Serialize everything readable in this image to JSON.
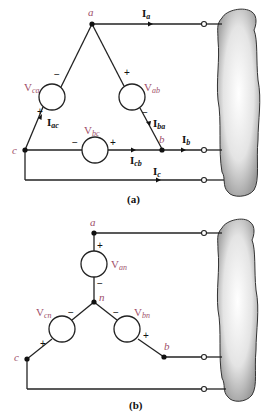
{
  "figure_a": {
    "caption": "(a)",
    "nodes": {
      "a": "a",
      "b": "b",
      "c": "c"
    },
    "sources": [
      {
        "id": "ca",
        "base": "V",
        "sub": "ca"
      },
      {
        "id": "ab",
        "base": "V",
        "sub": "ab"
      },
      {
        "id": "bc",
        "base": "V",
        "sub": "bc"
      }
    ],
    "currents": [
      {
        "id": "a",
        "base": "I",
        "sub": "a"
      },
      {
        "id": "b",
        "base": "I",
        "sub": "b"
      },
      {
        "id": "c",
        "base": "I",
        "sub": "c"
      },
      {
        "id": "ac",
        "base": "I",
        "sub": "ac"
      },
      {
        "id": "ba",
        "base": "I",
        "sub": "ba"
      },
      {
        "id": "cb",
        "base": "I",
        "sub": "cb"
      }
    ],
    "plus": "+",
    "minus": "−"
  },
  "figure_b": {
    "caption": "(b)",
    "nodes": {
      "a": "a",
      "b": "b",
      "c": "c",
      "n": "n"
    },
    "sources": [
      {
        "id": "an",
        "base": "V",
        "sub": "an"
      },
      {
        "id": "cn",
        "base": "V",
        "sub": "cn"
      },
      {
        "id": "bn",
        "base": "V",
        "sub": "bn"
      }
    ],
    "plus": "+",
    "minus": "−"
  },
  "colors": {
    "label": "#a0506a",
    "wire": "#222222",
    "load_fill": "#d8d8d8"
  }
}
